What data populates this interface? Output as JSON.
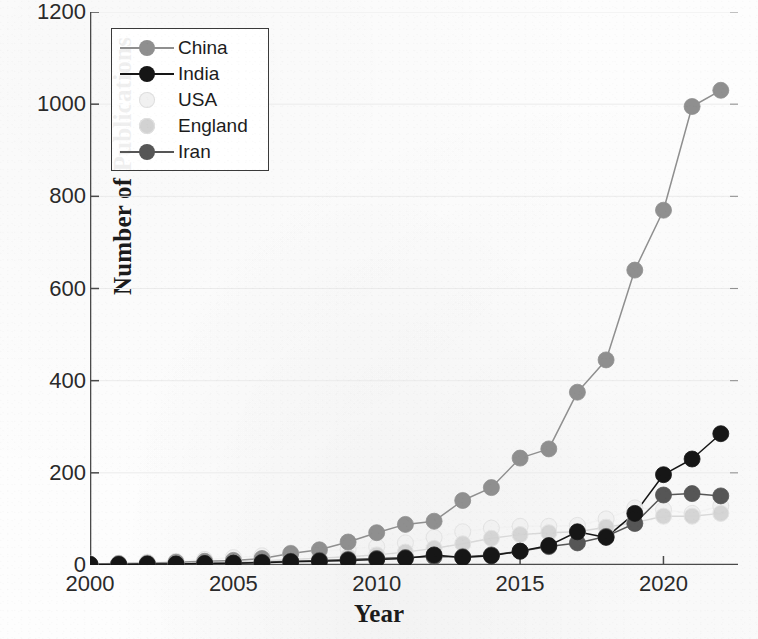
{
  "figure": {
    "background_color": "#fdfdfd",
    "axis_color": "#4a4a4a",
    "grid_color": "#ebebeb"
  },
  "axes": {
    "ylabel": "Number of Publications",
    "xlabel": "Year",
    "yticks": [
      "0",
      "200",
      "400",
      "600",
      "800",
      "1000",
      "1200"
    ],
    "xticks": [
      "2000",
      "2005",
      "2010",
      "2015",
      "2020"
    ]
  },
  "legend": {
    "entries": [
      {
        "label": "China",
        "color": "#8f8f8f",
        "has_line": true
      },
      {
        "label": "India",
        "color": "#161616",
        "has_line": true
      },
      {
        "label": "USA",
        "color": "#f1f1f1",
        "has_line": false
      },
      {
        "label": "England",
        "color": "#d2d2d2",
        "has_line": false
      },
      {
        "label": "Iran",
        "color": "#565656",
        "has_line": true
      }
    ]
  },
  "chart_data": {
    "type": "line",
    "title": "",
    "xlabel": "Year",
    "ylabel": "Number of Publications",
    "xlim": [
      2000,
      2022.6
    ],
    "ylim": [
      0,
      1200
    ],
    "ytick_step": 200,
    "xtick_step": 5,
    "grid": true,
    "legend_position": "upper-left",
    "marker": "circle",
    "x": [
      2000,
      2001,
      2002,
      2003,
      2004,
      2005,
      2006,
      2007,
      2008,
      2009,
      2010,
      2011,
      2012,
      2013,
      2014,
      2015,
      2016,
      2017,
      2018,
      2019,
      2020,
      2021,
      2022
    ],
    "series": [
      {
        "name": "China",
        "color": "#8f8f8f",
        "values": [
          2,
          3,
          4,
          6,
          8,
          10,
          14,
          25,
          33,
          50,
          70,
          88,
          95,
          140,
          168,
          232,
          252,
          375,
          445,
          640,
          770,
          995,
          1030
        ]
      },
      {
        "name": "India",
        "color": "#161616",
        "values": [
          1,
          1,
          2,
          2,
          3,
          4,
          5,
          7,
          8,
          10,
          12,
          14,
          22,
          16,
          20,
          30,
          42,
          72,
          60,
          112,
          196,
          230,
          285
        ]
      },
      {
        "name": "USA",
        "color": "#f1f1f1",
        "values": [
          2,
          4,
          6,
          8,
          12,
          16,
          20,
          26,
          30,
          34,
          40,
          48,
          60,
          72,
          80,
          84,
          84,
          86,
          100,
          124,
          120,
          112,
          128
        ]
      },
      {
        "name": "England",
        "color": "#d2d2d2",
        "values": [
          1,
          2,
          3,
          4,
          5,
          7,
          9,
          12,
          15,
          18,
          22,
          28,
          36,
          46,
          58,
          66,
          70,
          72,
          82,
          92,
          106,
          106,
          112
        ]
      },
      {
        "name": "Iran",
        "color": "#565656",
        "values": [
          1,
          1,
          2,
          2,
          3,
          4,
          6,
          8,
          10,
          12,
          14,
          16,
          18,
          18,
          22,
          30,
          40,
          48,
          62,
          90,
          152,
          155,
          150
        ]
      }
    ]
  }
}
